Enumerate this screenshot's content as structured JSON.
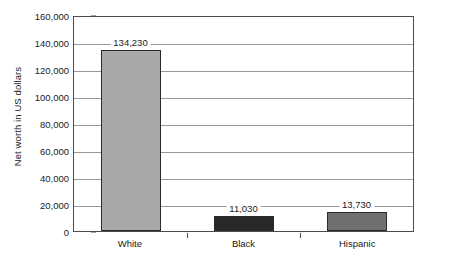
{
  "chart_data": {
    "type": "bar",
    "title": "",
    "xlabel": "",
    "ylabel": "Net worth in US dollars",
    "categories": [
      "White",
      "Black",
      "Hispanic"
    ],
    "values": [
      134230,
      11030,
      13730
    ],
    "value_labels": [
      "134,230",
      "11,030",
      "13,730"
    ],
    "bar_colors": [
      "#a9a9a9",
      "#282828",
      "#707070"
    ],
    "ylim": [
      0,
      160000
    ],
    "ytick_values": [
      0,
      20000,
      40000,
      60000,
      80000,
      100000,
      120000,
      140000,
      160000
    ],
    "ytick_labels": [
      "0",
      "20,000",
      "40,000",
      "60,000",
      "80,000",
      "100,000",
      "120,000",
      "140,000",
      "160,000"
    ],
    "grid": true,
    "grid_axis": "y",
    "legend": false,
    "legend_position": "none",
    "orientation": "vertical",
    "axis_line_color": "#4d4d4d",
    "gridline_color": "#9a9a9a",
    "bar_border_color": "#2b2b2b",
    "background_color": "#ffffff"
  }
}
